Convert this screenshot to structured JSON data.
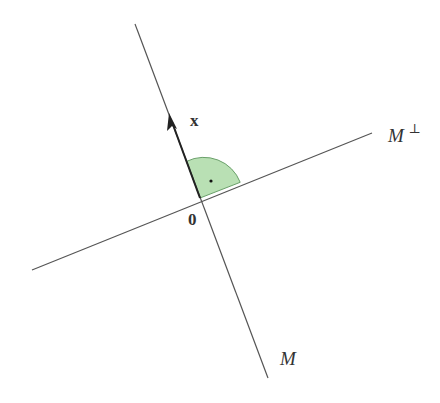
{
  "diagram": {
    "colors": {
      "line": "#555555",
      "vector": "#222222",
      "angle_fill": "#b9e0b4",
      "angle_stroke": "#6aa06a",
      "text": "#333333"
    },
    "origin": {
      "x": 200,
      "y": 198,
      "label": "0"
    },
    "line_M": {
      "x1": 135,
      "y1": 24,
      "x2": 268,
      "y2": 378,
      "label": "M"
    },
    "line_M_perp": {
      "x1": 32,
      "y1": 270,
      "x2": 372,
      "y2": 133,
      "label": "M",
      "label_sup": "⊥"
    },
    "vector_x": {
      "x1": 200,
      "y1": 198,
      "x2": 170,
      "y2": 171,
      "label": "x"
    },
    "right_angle_marker": {
      "type": "quarter-circle",
      "radius": 40,
      "dot": true
    }
  }
}
